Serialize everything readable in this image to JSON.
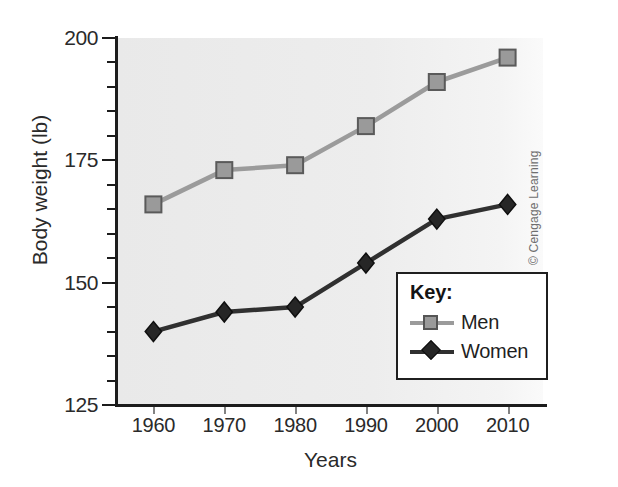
{
  "chart_data": {
    "type": "line",
    "title": "",
    "xlabel": "Years",
    "ylabel": "Body weight (lb)",
    "categories": [
      "1960",
      "1970",
      "1980",
      "1990",
      "2000",
      "2010"
    ],
    "x": [
      1960,
      1970,
      1980,
      1990,
      2000,
      2010
    ],
    "xlim": [
      1955,
      2015
    ],
    "ylim": [
      125,
      200
    ],
    "ytick_major": [
      "125",
      "150",
      "175",
      "200"
    ],
    "ytick_major_values": [
      125,
      150,
      175,
      200
    ],
    "ytick_minor_values": [
      130,
      135,
      140,
      145,
      155,
      160,
      165,
      170,
      180,
      185,
      190,
      195
    ],
    "grid": false,
    "legend_position": "inside-lower-right",
    "legend_title": "Key:",
    "series": [
      {
        "name": "Men",
        "marker": "square",
        "color": "#9a9a9a",
        "line_color": "#9b9b9b",
        "values": [
          166,
          173,
          174,
          182,
          191,
          196
        ]
      },
      {
        "name": "Women",
        "marker": "diamond",
        "color": "#262626",
        "line_color": "#303030",
        "values": [
          140,
          144,
          145,
          154,
          163,
          166
        ]
      }
    ],
    "annotations": [
      "© Cengage Learning"
    ]
  },
  "axes": {
    "y_title": "Body weight (lb)",
    "x_title": "Years",
    "y_labels": [
      "200",
      "175",
      "150",
      "125"
    ],
    "x_labels": [
      "1960",
      "1970",
      "1980",
      "1990",
      "2000",
      "2010"
    ]
  },
  "legend": {
    "title": "Key:",
    "entries": [
      {
        "label": "Men",
        "swatch": "gray-square-marker"
      },
      {
        "label": "Women",
        "swatch": "dark-diamond-marker"
      }
    ]
  },
  "credit": {
    "text": "© Cengage Learning"
  },
  "colors": {
    "men": "#9a9a9a",
    "women": "#262626",
    "plot_background": "#ececec",
    "axis": "#1c1c1c",
    "page_background": "#ffffff"
  }
}
